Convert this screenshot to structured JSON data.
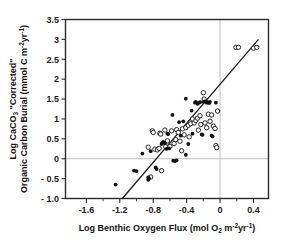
{
  "chart_data": {
    "type": "scatter",
    "title": "",
    "xlabel": "Log Benthic Oxygen Flux (mol O2 m-2yr-1)",
    "ylabel": "Log CaCO3 \"Corrected\" Organic Carbon Burial (mmol C m-2yr-1)",
    "xlabel_parts": {
      "main_1": "Log Benthic Oxygen Flux (mol O",
      "sub_1": "2",
      "main_2": " m",
      "sup_1": "-2",
      "main_3": "yr",
      "sup_2": "-1",
      "main_4": ")"
    },
    "ylabel_parts": {
      "line1_main_1": "Log CaCO",
      "line1_sub_1": "3",
      "line1_main_2": " \"Corrected\"",
      "line2_main_1": "Organic Carbon Burial (mmol C m",
      "line2_sup_1": "-2",
      "line2_main_2": "yr",
      "line2_sup_2": "-1",
      "line2_main_3": ")"
    },
    "xlim": [
      -1.85,
      0.58
    ],
    "ylim": [
      -1.0,
      3.5
    ],
    "xticks": [
      -1.6,
      -1.2,
      -0.8,
      -0.4,
      0,
      0.4
    ],
    "xtick_labels": [
      "-1.6",
      "-1.2",
      "-0.8",
      "-0.4",
      "0",
      "0.4"
    ],
    "xticks_minor": [
      -1.4,
      -1.0,
      -0.6,
      -0.2,
      0.2
    ],
    "yticks": [
      -1.0,
      -0.5,
      0,
      0.5,
      1,
      1.5,
      2,
      2.5,
      3,
      3.5
    ],
    "ytick_labels": [
      "- 1.0",
      "- 0.5",
      "0",
      "0.5",
      "1",
      "1.5",
      "2",
      "2.5",
      "3",
      "3.5"
    ],
    "grid": false,
    "reference_lines": [
      {
        "orientation": "horizontal",
        "value": 0,
        "color": "#b9b9b9"
      },
      {
        "orientation": "vertical",
        "value": 0,
        "color": "#b9b9b9"
      }
    ],
    "fit_line": {
      "x0": -1.17,
      "y0": -1.0,
      "x1": 0.46,
      "y1": 3.0,
      "color": "#151515"
    },
    "legend": {
      "position": "none",
      "entries": []
    },
    "series": [
      {
        "name": "filled",
        "marker": "filled-circle",
        "color": "#111111",
        "points": [
          [
            -1.25,
            -0.65
          ],
          [
            -1.03,
            -0.3
          ],
          [
            -1.0,
            -0.31
          ],
          [
            -0.93,
            0.13
          ],
          [
            -0.86,
            -0.47
          ],
          [
            -0.86,
            -0.53
          ],
          [
            -0.85,
            -0.5
          ],
          [
            -0.83,
            0.19
          ],
          [
            -0.77,
            -0.22
          ],
          [
            -0.76,
            -0.26
          ],
          [
            -0.7,
            0.37
          ],
          [
            -0.69,
            0.4
          ],
          [
            -0.68,
            0.42
          ],
          [
            -0.66,
            0.39
          ],
          [
            -0.64,
            0.25
          ],
          [
            -0.63,
            0.63
          ],
          [
            -0.62,
            0.62
          ],
          [
            -0.61,
            0.26
          ],
          [
            -0.57,
            1.1
          ],
          [
            -0.56,
            -0.05
          ],
          [
            -0.54,
            -0.06
          ],
          [
            -0.52,
            -0.04
          ],
          [
            -0.49,
            0.92
          ],
          [
            -0.47,
            0.58
          ],
          [
            -0.44,
            0.94
          ],
          [
            -0.41,
            1.51
          ],
          [
            -0.41,
            0.1
          ],
          [
            -0.38,
            0.37
          ],
          [
            -0.34,
            1.21
          ],
          [
            -0.33,
            0.63
          ],
          [
            -0.3,
            1.41
          ],
          [
            -0.29,
            1.43
          ],
          [
            -0.27,
            1.38
          ],
          [
            -0.26,
            1.4
          ],
          [
            -0.24,
            1.42
          ],
          [
            -0.22,
            0.61
          ],
          [
            -0.21,
            0.6
          ],
          [
            -0.2,
            1.43
          ],
          [
            -0.18,
            1.44
          ],
          [
            -0.16,
            1.41
          ],
          [
            -0.15,
            1.42
          ],
          [
            -0.13,
            1.4
          ],
          [
            -0.12,
            1.43
          ],
          [
            -0.1,
            0.58
          ],
          [
            -0.09,
            0.56
          ],
          [
            -0.05,
            1.41
          ]
        ]
      },
      {
        "name": "open",
        "marker": "open-circle",
        "color": "#111111",
        "points": [
          [
            -0.86,
            0.29
          ],
          [
            -0.83,
            -0.46
          ],
          [
            -0.81,
            0.7
          ],
          [
            -0.8,
            0.66
          ],
          [
            -0.78,
            0.24
          ],
          [
            -0.75,
            0.22
          ],
          [
            -0.73,
            0.26
          ],
          [
            -0.72,
            0.64
          ],
          [
            -0.71,
            0.62
          ],
          [
            -0.7,
            -0.3
          ],
          [
            -0.66,
            0.72
          ],
          [
            -0.65,
            0.3
          ],
          [
            -0.63,
            0.45
          ],
          [
            -0.6,
            0.31
          ],
          [
            -0.58,
            0.7
          ],
          [
            -0.55,
            0.38
          ],
          [
            -0.53,
            0.48
          ],
          [
            -0.52,
            0.73
          ],
          [
            -0.5,
            0.66
          ],
          [
            -0.48,
            0.44
          ],
          [
            -0.46,
            0.2
          ],
          [
            -0.45,
            0.75
          ],
          [
            -0.43,
            0.6
          ],
          [
            -0.41,
            0.78
          ],
          [
            -0.38,
            0.84
          ],
          [
            -0.37,
            0.55
          ],
          [
            -0.35,
            0.88
          ],
          [
            -0.33,
            1.0
          ],
          [
            -0.31,
            0.9
          ],
          [
            -0.29,
            0.96
          ],
          [
            -0.27,
            1.02
          ],
          [
            -0.26,
            0.72
          ],
          [
            -0.24,
            1.08
          ],
          [
            -0.23,
            0.86
          ],
          [
            -0.2,
            1.66
          ],
          [
            -0.19,
            1.5
          ],
          [
            -0.18,
            0.9
          ],
          [
            -0.16,
            0.78
          ],
          [
            -0.14,
            1.12
          ],
          [
            -0.12,
            0.94
          ],
          [
            -0.1,
            1.1
          ],
          [
            -0.08,
            0.82
          ],
          [
            -0.06,
            0.76
          ],
          [
            -0.05,
            0.33
          ],
          [
            -0.04,
            0.28
          ],
          [
            -0.03,
            1.2
          ],
          [
            0.19,
            2.8
          ],
          [
            0.22,
            2.8
          ],
          [
            0.4,
            2.78
          ],
          [
            0.44,
            2.8
          ]
        ]
      }
    ]
  }
}
